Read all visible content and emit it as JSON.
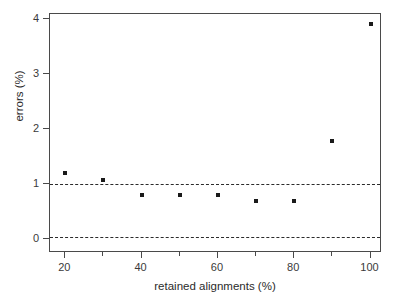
{
  "chart_data": {
    "type": "scatter",
    "title": "",
    "xlabel": "retained alignments (%)",
    "ylabel": "errors (%)",
    "xlim": [
      16,
      103
    ],
    "ylim": [
      -0.25,
      4.1
    ],
    "grid": false,
    "legend": null,
    "x_ticks": [
      20,
      40,
      60,
      80,
      100
    ],
    "x_tick_labels": [
      "20",
      "40",
      "60",
      "80",
      "100"
    ],
    "x_minor_ticks": [
      30,
      50,
      70,
      90
    ],
    "y_ticks": [
      0,
      1,
      2,
      3,
      4
    ],
    "y_tick_labels": [
      "0",
      "1",
      "2",
      "3",
      "4"
    ],
    "x": [
      20,
      30,
      40,
      50,
      60,
      70,
      80,
      90,
      100
    ],
    "values": [
      1.2,
      1.07,
      0.8,
      0.8,
      0.8,
      0.7,
      0.7,
      1.79,
      3.92
    ],
    "points": [
      {
        "x": 20,
        "y": 1.2
      },
      {
        "x": 30,
        "y": 1.07
      },
      {
        "x": 40,
        "y": 0.8
      },
      {
        "x": 50,
        "y": 0.8
      },
      {
        "x": 60,
        "y": 0.8
      },
      {
        "x": 70,
        "y": 0.7
      },
      {
        "x": 80,
        "y": 0.7
      },
      {
        "x": 90,
        "y": 1.79
      },
      {
        "x": 100,
        "y": 3.92
      }
    ],
    "reference_lines": [
      {
        "y": 1.0,
        "style": "dashed"
      },
      {
        "y": 0.05,
        "style": "dashed"
      }
    ],
    "marker": "square",
    "marker_color": "#1a1a1a",
    "frame_color": "#4a4a4a",
    "background": "#ffffff"
  }
}
